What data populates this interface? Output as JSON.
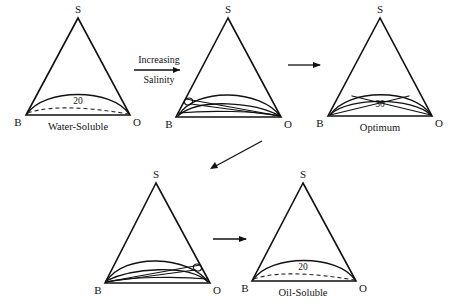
{
  "figure": {
    "background_color": "#ffffff",
    "line_color": "#111111",
    "width": 456,
    "height": 307
  },
  "vertex_labels": {
    "top": "S",
    "left": "B",
    "right": "O"
  },
  "panels": [
    {
      "id": "water-soluble",
      "caption": "Water-Soluble",
      "curve_label": "20",
      "vertex_top": "S",
      "vertex_left": "B",
      "vertex_right": "O",
      "has_dashed_tieline": true,
      "binodal_count": 1,
      "tieline_count": 0,
      "has_loop": false,
      "loop_side": ""
    },
    {
      "id": "winsor-type-i-transition",
      "caption": "",
      "curve_label": "",
      "vertex_top": "S",
      "vertex_left": "B",
      "vertex_right": "O",
      "has_dashed_tieline": false,
      "binodal_count": 2,
      "tieline_count": 3,
      "has_loop": true,
      "loop_side": "left"
    },
    {
      "id": "optimum",
      "caption": "Optimum",
      "curve_label": "30",
      "vertex_top": "S",
      "vertex_left": "B",
      "vertex_right": "O",
      "has_dashed_tieline": false,
      "binodal_count": 2,
      "tieline_count": 2,
      "has_loop": false,
      "loop_side": ""
    },
    {
      "id": "winsor-type-ii-transition",
      "caption": "",
      "curve_label": "",
      "vertex_top": "S",
      "vertex_left": "B",
      "vertex_right": "O",
      "has_dashed_tieline": false,
      "binodal_count": 2,
      "tieline_count": 3,
      "has_loop": true,
      "loop_side": "right"
    },
    {
      "id": "oil-soluble",
      "caption": "Oil-Soluble",
      "curve_label": "20",
      "vertex_top": "S",
      "vertex_left": "B",
      "vertex_right": "O",
      "has_dashed_tieline": true,
      "binodal_count": 1,
      "tieline_count": 0,
      "has_loop": false,
      "loop_side": ""
    }
  ],
  "annotations": {
    "salinity_top": "Increasing",
    "salinity_bottom": "Salinity"
  },
  "arrows": [
    {
      "id": "arrow-salinity",
      "direction": "right"
    },
    {
      "id": "arrow-top-right",
      "direction": "right"
    },
    {
      "id": "arrow-diagonal",
      "direction": "down-left"
    },
    {
      "id": "arrow-bottom",
      "direction": "right"
    }
  ]
}
